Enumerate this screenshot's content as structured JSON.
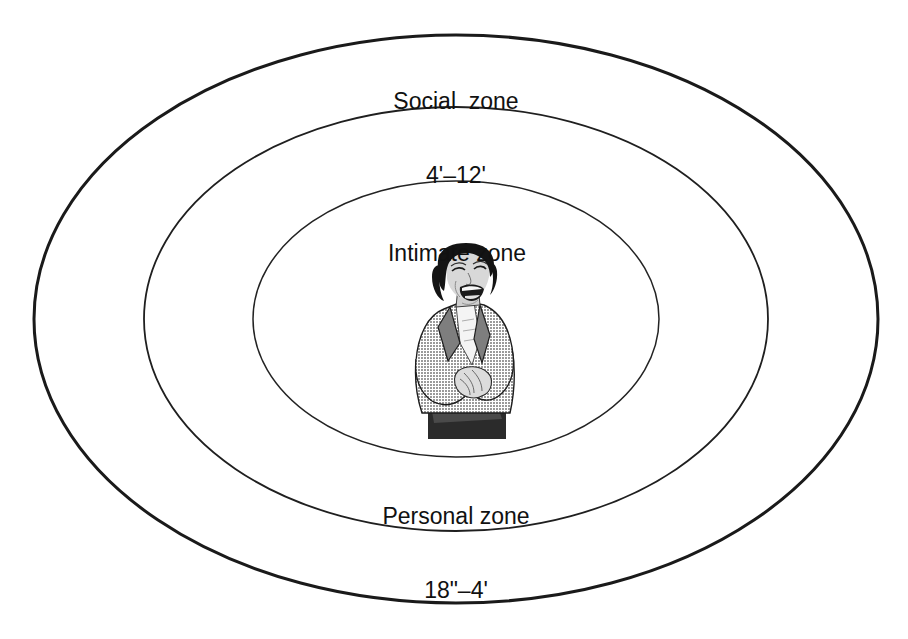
{
  "diagram": {
    "background_color": "#ffffff",
    "line_color": "#1a1a1a",
    "zones": [
      {
        "id": "social",
        "name": "Social zone",
        "label_line1": "Social  zone",
        "label_line2": "4'–12'",
        "range_min": "4'",
        "range_max": "12'",
        "ring_index": 3,
        "stroke_width": 3
      },
      {
        "id": "personal",
        "name": "Personal zone",
        "label_line1": "Personal zone",
        "label_line2": "18\"–4'",
        "range_min": "18\"",
        "range_max": "4'",
        "ring_index": 2,
        "stroke_width": 1.8
      },
      {
        "id": "intimate",
        "name": "Intimate zone",
        "label_line1": "Intimate zone",
        "label_line2": "",
        "range_min": "0",
        "range_max": "18\"",
        "ring_index": 1,
        "stroke_width": 1.5
      }
    ],
    "center_figure": {
      "name": "laughing-woman-illustration",
      "description": "Halftone illustration of a laughing woman in a gray blazer with clasped hands",
      "hair_color": "#151515",
      "jacket_color": "#8f8f8f",
      "skin_color": "#d9d9d9",
      "blouse_color": "#f2f2f2",
      "skirt_color": "#2a2a2a"
    }
  }
}
